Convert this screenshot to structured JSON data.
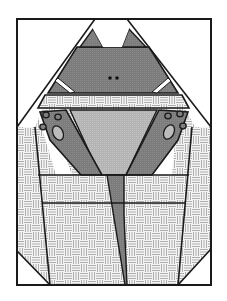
{
  "colors": {
    "background": "#ffffff",
    "outline": "#1a1a1a",
    "cat_dark": "#808080",
    "belly_light": "#b8b8b8",
    "paw_pad": "#bcbcbc",
    "weave_line": "#9a9a9a",
    "weave_bg": "#f4f4f4"
  },
  "figure": {
    "parts": [
      "ears",
      "head",
      "eyes",
      "basket-rim",
      "belly",
      "left-paw",
      "right-paw",
      "tail",
      "basket"
    ]
  }
}
